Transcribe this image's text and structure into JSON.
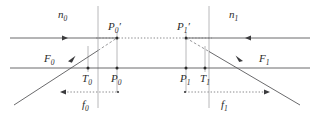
{
  "figure": {
    "type": "optical-ray-diagram",
    "width": 320,
    "height": 114,
    "background_color": "#ffffff"
  },
  "colors": {
    "ray_line": "#59595b",
    "axis_line": "#59595b",
    "interface_line": "#b0b0b2",
    "dotted_line": "#7d7d80",
    "dashed_ray": "#8c8c8f",
    "point_dot": "#2b2b2b",
    "label_text": "#2b2b2b",
    "dimension_line": "#7d7d80"
  },
  "media_labels": [
    {
      "name": "n0",
      "base": "n",
      "subscript": "0",
      "x": 63,
      "y": 17
    },
    {
      "name": "n1",
      "base": "n",
      "subscript": "1",
      "x": 233,
      "y": 17
    }
  ],
  "point_labels": [
    {
      "name": "P0-prime",
      "base": "P",
      "subscript": "0",
      "prime": true,
      "x": 112,
      "y": 29
    },
    {
      "name": "P1-prime",
      "base": "P",
      "subscript": "1",
      "prime": true,
      "x": 181,
      "y": 29
    },
    {
      "name": "F0",
      "base": "F",
      "subscript": "0",
      "prime": false,
      "x": 48,
      "y": 62
    },
    {
      "name": "F1",
      "base": "F",
      "subscript": "1",
      "prime": false,
      "x": 263,
      "y": 62
    },
    {
      "name": "T0",
      "base": "T",
      "subscript": "0",
      "prime": false,
      "x": 84,
      "y": 84
    },
    {
      "name": "P0",
      "base": "P",
      "subscript": "0",
      "prime": false,
      "x": 113,
      "y": 84
    },
    {
      "name": "P1",
      "base": "P",
      "subscript": "1",
      "prime": false,
      "x": 182,
      "y": 84
    },
    {
      "name": "T1",
      "base": "T",
      "subscript": "1",
      "prime": false,
      "x": 206,
      "y": 84
    },
    {
      "name": "f0",
      "base": "f",
      "subscript": "0",
      "prime": false,
      "x": 86,
      "y": 108
    },
    {
      "name": "f1",
      "base": "f",
      "subscript": "1",
      "prime": false,
      "x": 225,
      "y": 108
    }
  ],
  "geometry": {
    "upper_ray_y": 38,
    "optical_axis_y": 68,
    "dimension_y": 92,
    "interface_x_left": 98,
    "interface_x_right": 209,
    "P0_x": 117,
    "P1_x": 186,
    "T0_x": 88,
    "T1_x": 205,
    "F0_x": 57,
    "F1_x": 266,
    "left_edge": 10,
    "right_edge": 310
  },
  "segments": {
    "upper_left_ray": {
      "name": "incoming-ray-left",
      "x1": 10,
      "y1": 38,
      "x2": 117,
      "y2": 38
    },
    "upper_right_ray": {
      "name": "incoming-ray-right",
      "x1": 186,
      "y1": 38,
      "x2": 310,
      "y2": 38
    },
    "optical_axis": {
      "name": "optical-axis",
      "x1": 10,
      "y1": 68,
      "x2": 310,
      "y2": 68
    },
    "left_oblique": {
      "name": "oblique-ray-left",
      "x1": 14,
      "y1": 105,
      "x2": 117,
      "y2": 38
    },
    "right_oblique": {
      "name": "oblique-ray-right",
      "x1": 186,
      "y1": 38,
      "x2": 300,
      "y2": 105
    },
    "dotted_middle": {
      "name": "dotted-connector",
      "x1": 98,
      "y1": 38,
      "x2": 209,
      "y2": 38
    },
    "f0_dimension": {
      "name": "f0-dimension",
      "x1": 62,
      "y1": 92,
      "x2": 118,
      "y2": 92,
      "arrow": "left"
    },
    "f1_dimension": {
      "name": "f1-dimension",
      "x1": 185,
      "y1": 92,
      "x2": 268,
      "y2": 92,
      "arrow": "right"
    }
  },
  "arrow_markers": [
    {
      "name": "arrow-upper-left",
      "x": 65,
      "y": 38,
      "direction": "right"
    },
    {
      "name": "arrow-upper-right",
      "x": 247,
      "y": 38,
      "direction": "left"
    },
    {
      "name": "arrow-oblique-left",
      "x": 72,
      "y": 58,
      "direction": "up-right"
    },
    {
      "name": "arrow-oblique-right",
      "x": 239,
      "y": 58,
      "direction": "down-right"
    }
  ],
  "dots": [
    {
      "name": "dot-P0-prime",
      "x": 117,
      "y": 38
    },
    {
      "name": "dot-P1-prime",
      "x": 186,
      "y": 38
    },
    {
      "name": "dot-T0",
      "x": 88,
      "y": 68
    },
    {
      "name": "dot-P0",
      "x": 117,
      "y": 68
    },
    {
      "name": "dot-P1",
      "x": 186,
      "y": 68
    },
    {
      "name": "dot-T1",
      "x": 205,
      "y": 68
    },
    {
      "name": "dot-f0-end",
      "x": 118,
      "y": 92
    },
    {
      "name": "dot-f1-end",
      "x": 268,
      "y": 92
    }
  ]
}
